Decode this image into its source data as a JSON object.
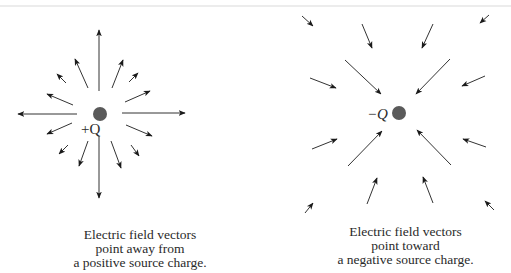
{
  "colors": {
    "arrow": "#1a1a1a",
    "charge": "#5a5a5a",
    "text": "#2a2a2a"
  },
  "positive_figure": {
    "charge_label": "+Q",
    "caption": {
      "line1": "Electric field vectors",
      "line2": "point away from",
      "line3": "a positive source charge."
    }
  },
  "negative_figure": {
    "charge_label": "−Q",
    "caption": {
      "line1": "Electric field vectors",
      "line2": "point toward",
      "line3": "a negative source charge."
    }
  }
}
